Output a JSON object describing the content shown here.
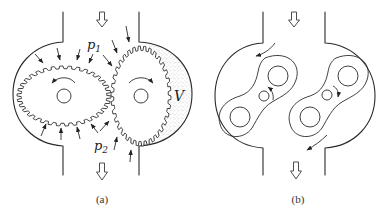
{
  "figure": {
    "panels": [
      {
        "id": "a",
        "caption": "(a)",
        "title": "external gear pump",
        "labels": {
          "inlet_pressure": "p",
          "inlet_pressure_sub": "1",
          "outlet_pressure": "p",
          "outlet_pressure_sub": "2",
          "volume": "V"
        },
        "flow_direction": "top-to-bottom",
        "left_gear_rotation": "counterclockwise",
        "right_gear_rotation": "clockwise"
      },
      {
        "id": "b",
        "caption": "(b)",
        "title": "lobe (roots) pump",
        "flow_direction": "top-to-bottom",
        "rotor_count": 2
      }
    ],
    "colors": {
      "line": "#2a2a2a",
      "background": "#ffffff",
      "stipple": "#555555"
    }
  }
}
